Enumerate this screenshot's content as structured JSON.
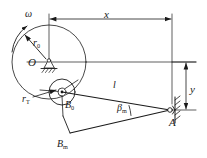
{
  "diagram": {
    "stroke_color": "#1a1a1a",
    "background": "#ffffff",
    "labels": {
      "x_distance": "x",
      "y_distance": "y",
      "angular_velocity": "ω",
      "crank_radius": "r",
      "crank_radius_sub": "0",
      "pin_radius": "r",
      "pin_radius_sub": "T",
      "pivot_center": "O",
      "joint_initial": "B",
      "joint_initial_sub": "0",
      "joint_max": "B",
      "joint_max_sub": "m",
      "link_length": "l",
      "angle_beta": "β",
      "angle_beta_sub": "m",
      "point_a": "A"
    },
    "geometry": {
      "center_O": [
        49,
        62
      ],
      "big_circle_radius": 37,
      "small_circle_center": [
        62,
        92
      ],
      "small_circle_radius": 13,
      "hub_radius": 4,
      "point_A": [
        172,
        110
      ],
      "point_Bm": [
        70,
        133
      ],
      "x_dim_left": 49,
      "x_dim_right": 172,
      "x_dim_y": 19,
      "y_dim_x": 186,
      "y_dim_top": 62,
      "y_dim_bottom": 110
    }
  }
}
